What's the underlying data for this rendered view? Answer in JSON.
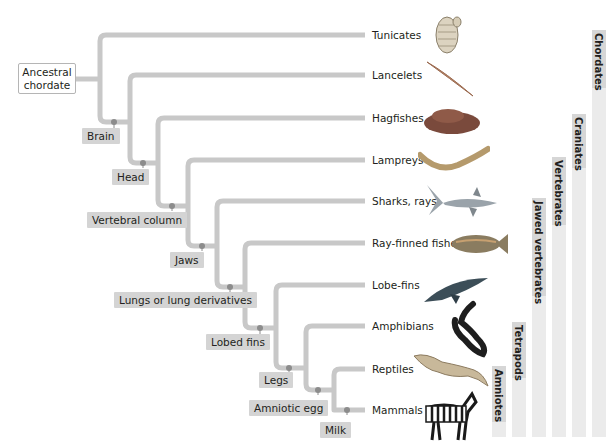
{
  "diagram": {
    "type": "phylogenetic-tree",
    "root": {
      "label_line1": "Ancestral",
      "label_line2": "chordate"
    },
    "taxa": [
      {
        "name": "Tunicates",
        "y": 35
      },
      {
        "name": "Lancelets",
        "y": 75
      },
      {
        "name": "Hagfishes",
        "y": 118
      },
      {
        "name": "Lampreys",
        "y": 160
      },
      {
        "name": "Sharks, rays",
        "y": 201
      },
      {
        "name": "Ray-finned fishes",
        "y": 243
      },
      {
        "name": "Lobe-fins",
        "y": 285
      },
      {
        "name": "Amphibians",
        "y": 326
      },
      {
        "name": "Reptiles",
        "y": 369
      },
      {
        "name": "Mammals",
        "y": 410
      }
    ],
    "derived_characters": [
      {
        "label": "Brain"
      },
      {
        "label": "Head"
      },
      {
        "label": "Vertebral column"
      },
      {
        "label": "Jaws"
      },
      {
        "label": "Lungs or lung derivatives"
      },
      {
        "label": "Lobed fins"
      },
      {
        "label": "Legs"
      },
      {
        "label": "Amniotic egg"
      },
      {
        "label": "Milk"
      }
    ],
    "clades": [
      {
        "name": "Chordates",
        "from_taxon": "Tunicates"
      },
      {
        "name": "Craniates",
        "from_taxon": "Hagfishes"
      },
      {
        "name": "Vertebrates",
        "from_taxon": "Lampreys"
      },
      {
        "name": "Jawed vertebrates",
        "from_taxon": "Sharks, rays"
      },
      {
        "name": "Tetrapods",
        "from_taxon": "Amphibians"
      },
      {
        "name": "Amniotes",
        "from_taxon": "Reptiles"
      }
    ],
    "colors": {
      "branch": "#c8c8c8",
      "node_dot": "#8c8c8c",
      "label_bg": "#d4d4d4",
      "clade_bar": "#ebebeb"
    }
  }
}
